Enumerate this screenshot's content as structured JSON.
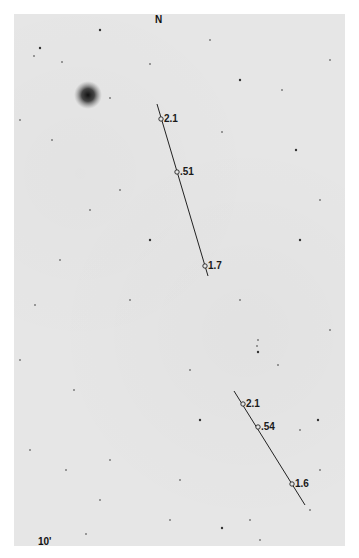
{
  "plate": {
    "orientation_label": "N",
    "scale_label": "10'",
    "background_color": "#e6e6e6"
  },
  "bright_object": {
    "cx": 88,
    "cy": 95,
    "r": 10
  },
  "tracks": [
    {
      "name": "track-upper",
      "line": {
        "x1": 157,
        "y1": 104,
        "x2": 208,
        "y2": 276
      },
      "points": [
        {
          "label": "2.1",
          "cx": 161,
          "cy": 119
        },
        {
          "label": ".51",
          "cx": 177,
          "cy": 172
        },
        {
          "label": "1.7",
          "cx": 205,
          "cy": 266
        }
      ]
    },
    {
      "name": "track-lower",
      "line": {
        "x1": 234,
        "y1": 391,
        "x2": 305,
        "y2": 505
      },
      "points": [
        {
          "label": "2.1",
          "cx": 243,
          "cy": 404
        },
        {
          "label": ".54",
          "cx": 258,
          "cy": 427
        },
        {
          "label": "1.6",
          "cx": 292,
          "cy": 484
        }
      ]
    }
  ],
  "stars": [
    [
      40,
      48
    ],
    [
      34,
      56
    ],
    [
      62,
      62
    ],
    [
      150,
      64
    ],
    [
      110,
      98
    ],
    [
      296,
      150
    ],
    [
      52,
      140
    ],
    [
      222,
      132
    ],
    [
      320,
      200
    ],
    [
      90,
      210
    ],
    [
      300,
      240
    ],
    [
      130,
      300
    ],
    [
      60,
      260
    ],
    [
      258,
      340
    ],
    [
      257,
      346
    ],
    [
      258,
      352
    ],
    [
      20,
      360
    ],
    [
      278,
      365
    ],
    [
      74,
      390
    ],
    [
      190,
      370
    ],
    [
      318,
      420
    ],
    [
      30,
      450
    ],
    [
      110,
      460
    ],
    [
      300,
      430
    ],
    [
      250,
      520
    ],
    [
      222,
      528
    ],
    [
      260,
      540
    ],
    [
      100,
      500
    ],
    [
      310,
      510
    ],
    [
      180,
      480
    ],
    [
      150,
      240
    ],
    [
      240,
      300
    ],
    [
      120,
      190
    ],
    [
      35,
      305
    ],
    [
      330,
      330
    ],
    [
      200,
      420
    ],
    [
      170,
      520
    ],
    [
      86,
      534
    ],
    [
      66,
      470
    ],
    [
      320,
      470
    ],
    [
      240,
      80
    ],
    [
      282,
      90
    ],
    [
      20,
      120
    ],
    [
      210,
      40
    ],
    [
      330,
      60
    ],
    [
      100,
      30
    ]
  ]
}
